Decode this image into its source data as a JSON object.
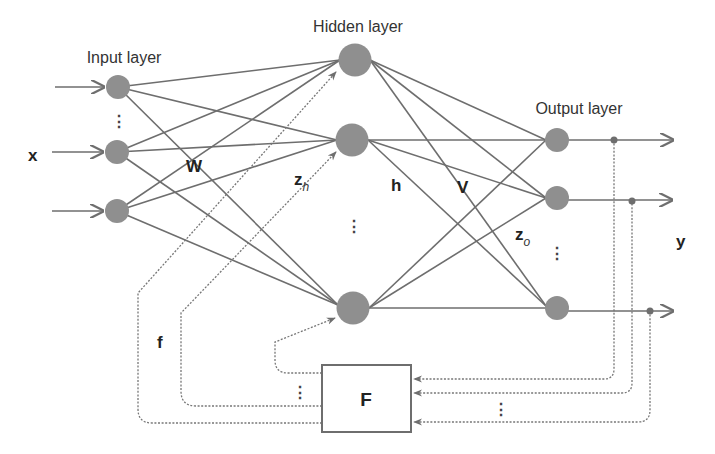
{
  "diagram": {
    "layers": {
      "input": {
        "title": "Input layer",
        "symbol": "x",
        "weights_label": "W",
        "node_count_shown": 3
      },
      "hidden": {
        "title": "Hidden layer",
        "preactivation_label": "z",
        "preactivation_sub": "h",
        "output_label": "h",
        "weights_label": "V",
        "node_count_shown": 3
      },
      "output": {
        "title": "Output layer",
        "preactivation_label": "z",
        "preactivation_sub": "o",
        "symbol": "y",
        "node_count_shown": 3
      }
    },
    "feedback": {
      "block_label": "F",
      "signal_label": "f"
    },
    "ellipsis": "⋮",
    "colors": {
      "node": "#8f8f8f",
      "edge": "#6e6e6e",
      "text": "#333333",
      "background": "#ffffff"
    }
  }
}
